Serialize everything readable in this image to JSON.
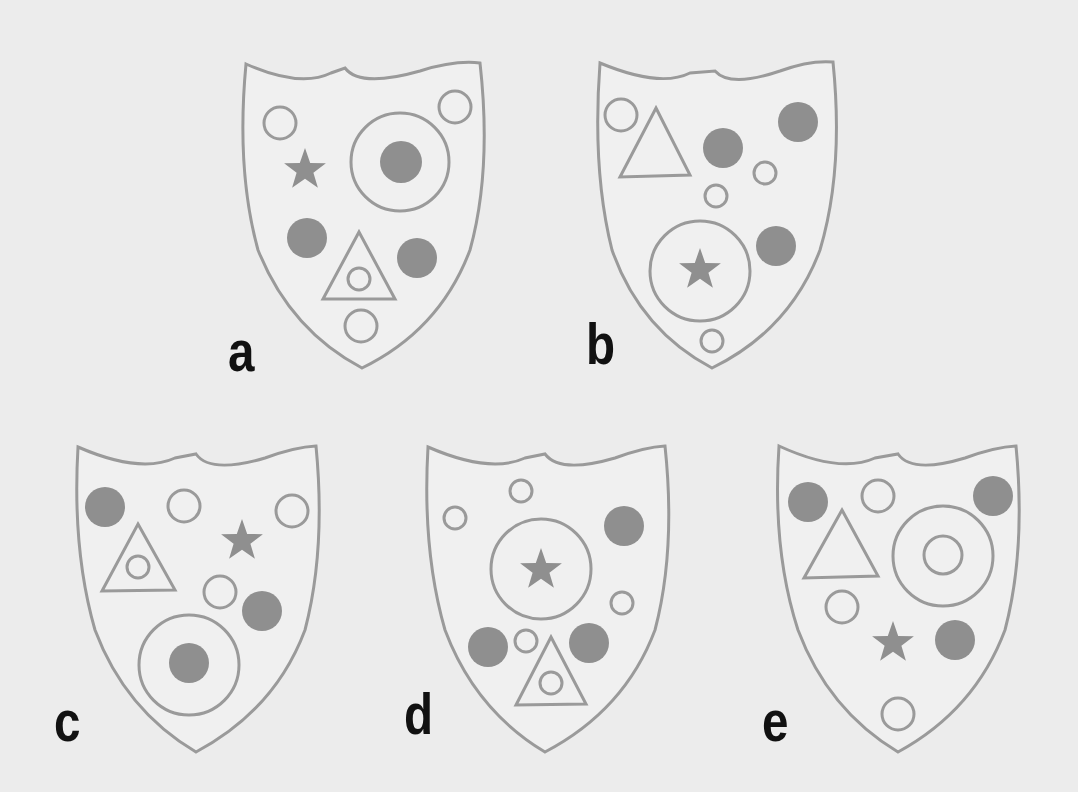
{
  "puzzle": {
    "description": "Five shields containing shapes; odd-one-out style visual puzzle",
    "colors": {
      "background": "#ececec",
      "stroke": "#9a9a9a",
      "fill": "#8f8f8f",
      "shield_fill": "#f0f0f0",
      "label": "#111111"
    },
    "shields": [
      {
        "label": "a",
        "items": [
          "open circle (top-left)",
          "open circle (top-right)",
          "filled star",
          "large ring containing filled circle",
          "filled circle (left)",
          "triangle containing small open circle",
          "filled circle (right)",
          "open circle (bottom)"
        ]
      },
      {
        "label": "b",
        "items": [
          "open circle (top-left)",
          "open triangle",
          "filled circle (center)",
          "filled circle (top-right)",
          "small open circle (right)",
          "small open circle (center)",
          "large ring containing filled star",
          "filled circle (right)",
          "small open circle (bottom)"
        ]
      },
      {
        "label": "c",
        "items": [
          "filled circle (top-left)",
          "open circle (top)",
          "filled star",
          "open circle (top-right)",
          "triangle containing small open circle",
          "open circle (center)",
          "filled circle (right)",
          "large ring containing filled circle"
        ]
      },
      {
        "label": "d",
        "items": [
          "small open circle (top)",
          "small open circle (left)",
          "filled circle (top-right)",
          "large ring containing filled star",
          "small open circle (right)",
          "filled circle (bottom-left)",
          "small open circle (bottom-center)",
          "filled circle (bottom-right)",
          "triangle containing small open circle"
        ]
      },
      {
        "label": "e",
        "items": [
          "filled circle (top-left)",
          "open circle (top)",
          "filled circle (top-right)",
          "open triangle",
          "large ring containing open circle",
          "open circle (left)",
          "filled star",
          "filled circle (right)",
          "open circle (bottom)"
        ]
      }
    ]
  }
}
